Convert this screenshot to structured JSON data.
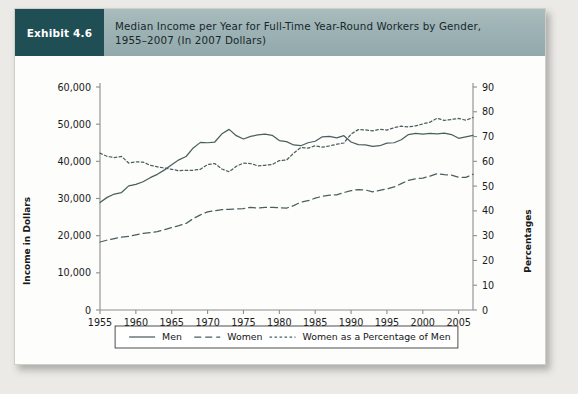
{
  "exhibit": {
    "tag": "Exhibit 4.6",
    "title_line1": "Median Income per Year for Full-Time Year-Round Workers by Gender,",
    "title_line2": "1955–2007 (In 2007 Dollars)"
  },
  "colors": {
    "tag_background": "#1f4e54",
    "header_background": "#9db2b4",
    "line": "#4a5f5e",
    "page_background": "#ebeae6",
    "card_background": "#fdfdfc",
    "axis": "#8d8d8d",
    "text": "#1a1a1a"
  },
  "legend": {
    "items": [
      {
        "label": "Men",
        "style": "solid"
      },
      {
        "label": "Women",
        "style": "dashed"
      },
      {
        "label": "Women as a Percentage of Men",
        "style": "dotted"
      }
    ]
  },
  "chart_data": {
    "type": "line",
    "title": "Median Income per Year for Full-Time Year-Round Workers by Gender, 1955–2007 (In 2007 Dollars)",
    "xlabel": "",
    "ylabel": "Income in Dollars",
    "y2label": "Percentages",
    "xlim": [
      1955,
      2007
    ],
    "ylim": [
      0,
      60000
    ],
    "y2lim": [
      0,
      90
    ],
    "grid": false,
    "legend_position": "bottom",
    "xticks": [
      1955,
      1960,
      1965,
      1970,
      1975,
      1980,
      1985,
      1990,
      1995,
      2000,
      2005
    ],
    "yticks": [
      0,
      10000,
      20000,
      30000,
      40000,
      50000,
      60000
    ],
    "yticklabels": [
      "0",
      "10,000",
      "20,000",
      "30,000",
      "40,000",
      "50,000",
      "60,000"
    ],
    "y2ticks": [
      0,
      10,
      20,
      30,
      40,
      50,
      60,
      70,
      80,
      90
    ],
    "y2ticklabels": [
      "0",
      "10",
      "20",
      "30",
      "40",
      "50",
      "60",
      "70",
      "80",
      "90"
    ],
    "x": [
      1955,
      1956,
      1957,
      1958,
      1959,
      1960,
      1961,
      1962,
      1963,
      1964,
      1965,
      1966,
      1967,
      1968,
      1969,
      1970,
      1971,
      1972,
      1973,
      1974,
      1975,
      1976,
      1977,
      1978,
      1979,
      1980,
      1981,
      1982,
      1983,
      1984,
      1985,
      1986,
      1987,
      1988,
      1989,
      1990,
      1991,
      1992,
      1993,
      1994,
      1995,
      1996,
      1997,
      1998,
      1999,
      2000,
      2001,
      2002,
      2003,
      2004,
      2005,
      2006,
      2007
    ],
    "series": [
      {
        "name": "Men",
        "style": "solid",
        "axis": "left",
        "unit": "dollars",
        "values": [
          28900,
          30300,
          31200,
          31600,
          33400,
          33800,
          34500,
          35600,
          36500,
          37700,
          39100,
          40400,
          41300,
          43600,
          45100,
          45000,
          45200,
          47400,
          48600,
          46900,
          46000,
          46700,
          47100,
          47300,
          47000,
          45600,
          45300,
          44400,
          44200,
          45000,
          45400,
          46600,
          46700,
          46300,
          46900,
          45200,
          44500,
          44400,
          44000,
          44200,
          44900,
          45000,
          45800,
          47200,
          47500,
          47300,
          47500,
          47400,
          47600,
          47200,
          46200,
          46600,
          47000
        ]
      },
      {
        "name": "Women",
        "style": "dashed",
        "axis": "left",
        "unit": "dollars",
        "values": [
          18300,
          18800,
          19200,
          19600,
          19800,
          20200,
          20600,
          20800,
          21100,
          21600,
          22200,
          22700,
          23300,
          24600,
          25600,
          26400,
          26700,
          27000,
          27100,
          27200,
          27300,
          27600,
          27400,
          27600,
          27600,
          27500,
          27400,
          28100,
          29000,
          29400,
          30100,
          30600,
          30900,
          31000,
          31600,
          32100,
          32400,
          32300,
          31800,
          32200,
          32600,
          33100,
          34000,
          34900,
          35300,
          35500,
          36000,
          36700,
          36400,
          36300,
          35700,
          35700,
          36500
        ]
      },
      {
        "name": "Women as a Percentage of Men",
        "style": "dotted",
        "axis": "right",
        "unit": "percent",
        "values": [
          63.3,
          62.0,
          61.5,
          62.0,
          59.3,
          59.8,
          59.7,
          58.4,
          57.8,
          57.3,
          56.8,
          56.2,
          56.4,
          56.4,
          56.8,
          58.7,
          59.1,
          56.9,
          55.8,
          58.0,
          59.3,
          59.1,
          58.2,
          58.4,
          58.7,
          60.3,
          60.5,
          63.3,
          65.6,
          65.3,
          66.3,
          65.7,
          66.2,
          66.9,
          67.4,
          71.0,
          72.8,
          72.7,
          72.3,
          72.9,
          72.6,
          73.6,
          74.2,
          73.9,
          74.3,
          75.1,
          75.8,
          77.4,
          76.5,
          76.9,
          77.3,
          76.6,
          77.7
        ]
      }
    ]
  }
}
